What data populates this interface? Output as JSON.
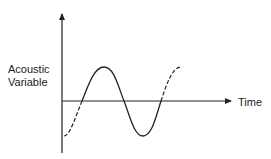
{
  "diagram": {
    "title": "",
    "y_axis_label_line1": "Acoustic",
    "y_axis_label_line2": "Variable",
    "x_axis_label": "Time",
    "colors": {
      "line": "#222222",
      "background": "#ffffff"
    },
    "wave": {
      "solid_segment": "zero-crossing up -> peak -> zero -> trough -> zero-crossing up",
      "dashed_segments": [
        "trough to first zero-crossing (left)",
        "last zero-crossing to peak (right)"
      ]
    }
  }
}
